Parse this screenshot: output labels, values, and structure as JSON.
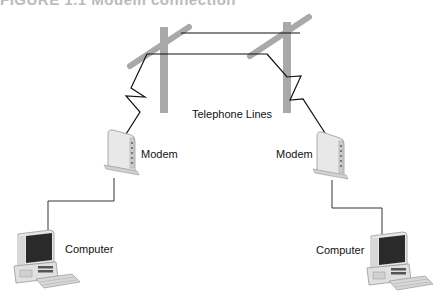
{
  "figure": {
    "title_partial": "FIGURE 1.1  Modem connection"
  },
  "labels": {
    "telephone_lines": "Telephone Lines",
    "modem_left": "Modem",
    "modem_right": "Modem",
    "computer_left": "Computer",
    "computer_right": "Computer"
  },
  "colors": {
    "pole": "#a9a9a9",
    "wire": "#111111",
    "device_body": "#e6e6e6",
    "screen": "#2a2a2a"
  },
  "nodes": [
    {
      "id": "computer-left",
      "type": "computer",
      "label": "Computer"
    },
    {
      "id": "modem-left",
      "type": "modem",
      "label": "Modem"
    },
    {
      "id": "pole-left",
      "type": "telephone-pole"
    },
    {
      "id": "pole-right",
      "type": "telephone-pole"
    },
    {
      "id": "modem-right",
      "type": "modem",
      "label": "Modem"
    },
    {
      "id": "computer-right",
      "type": "computer",
      "label": "Computer"
    }
  ],
  "edges": [
    {
      "from": "computer-left",
      "to": "modem-left"
    },
    {
      "from": "modem-left",
      "to": "pole-left"
    },
    {
      "from": "pole-left",
      "to": "pole-right",
      "label": "Telephone Lines"
    },
    {
      "from": "pole-right",
      "to": "modem-right"
    },
    {
      "from": "modem-right",
      "to": "computer-right"
    }
  ]
}
